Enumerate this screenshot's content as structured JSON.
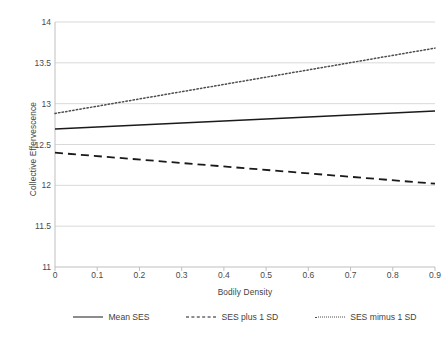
{
  "chart_data": {
    "type": "line",
    "title": "",
    "xlabel": "Bodily Density",
    "ylabel": "Collective Effervescence",
    "xlim": [
      0,
      0.9
    ],
    "ylim": [
      11,
      14
    ],
    "x": [
      0,
      0.9
    ],
    "xticks": [
      "0",
      "0.1",
      "0.2",
      "0.3",
      "0.4",
      "0.5",
      "0.6",
      "0.7",
      "0.8",
      "0.9"
    ],
    "xtick_values": [
      0,
      0.1,
      0.2,
      0.3,
      0.4,
      0.5,
      0.6,
      0.7,
      0.8,
      0.9
    ],
    "yticks": [
      "11",
      "11.5",
      "12",
      "12.5",
      "13",
      "13.5",
      "14"
    ],
    "ytick_values": [
      11,
      11.5,
      12,
      12.5,
      13,
      13.5,
      14
    ],
    "grid": "horizontal",
    "legend_position": "bottom",
    "series": [
      {
        "name": "Mean SES",
        "style": "solid",
        "color": "#1a1a1a",
        "values": [
          12.69,
          12.91
        ]
      },
      {
        "name": "SES plus 1 SD",
        "style": "dashed",
        "color": "#1a1a1a",
        "values": [
          12.4,
          12.02
        ]
      },
      {
        "name": "SES mimus 1 SD",
        "style": "dotted",
        "color": "#4d4d4d",
        "values": [
          12.88,
          13.68
        ]
      }
    ]
  }
}
